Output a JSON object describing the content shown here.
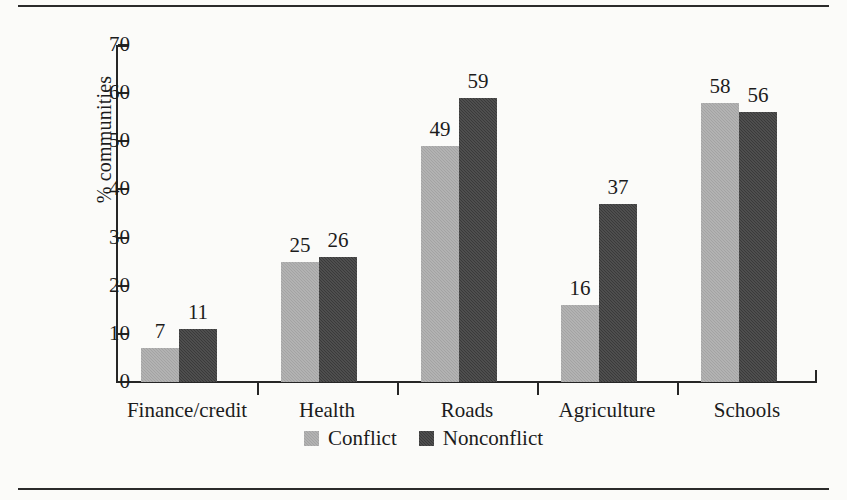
{
  "chart_data": {
    "type": "bar",
    "title": "",
    "subtitle": "",
    "xlabel": "",
    "ylabel": "% communities",
    "ylim": [
      0,
      70
    ],
    "yticks": [
      0,
      10,
      20,
      30,
      40,
      50,
      60,
      70
    ],
    "grid": false,
    "legend_position": "bottom-center",
    "categories": [
      "Finance/credit",
      "Health",
      "Roads",
      "Agriculture",
      "Schools"
    ],
    "series": [
      {
        "name": "Conflict",
        "color": "#a3a3a3",
        "values": [
          7,
          25,
          49,
          16,
          58
        ]
      },
      {
        "name": "Nonconflict",
        "color": "#3a3a3a",
        "values": [
          11,
          26,
          59,
          37,
          56
        ]
      }
    ],
    "data_labels": [
      [
        "7",
        "11"
      ],
      [
        "25",
        "26"
      ],
      [
        "49",
        "59"
      ],
      [
        "16",
        "37"
      ],
      [
        "58",
        "56"
      ]
    ],
    "ytick_labels": [
      "0",
      "10",
      "20",
      "30",
      "40",
      "50",
      "60",
      "70"
    ]
  },
  "legend": {
    "items": [
      {
        "label": "Conflict",
        "swatch": "light-gray-square-icon"
      },
      {
        "label": "Nonconflict",
        "swatch": "dark-gray-square-icon"
      }
    ]
  }
}
